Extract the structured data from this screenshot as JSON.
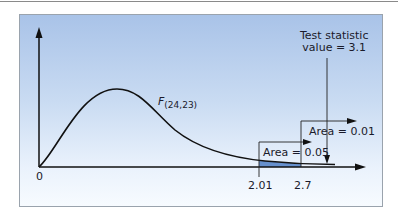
{
  "diagram": {
    "type": "F-distribution critical value illustration",
    "curve_label_main": "F",
    "curve_label_sub": "(24,23)",
    "origin_label": "0",
    "test_statistic": {
      "line1": "Test statistic",
      "line2": "value = 3.1",
      "value": 3.1
    },
    "critical_values": [
      {
        "x_label": "2.01",
        "area_label": "Area = 0.05",
        "area": 0.05
      },
      {
        "x_label": "2.7",
        "area_label": "Area = 0.01",
        "area": 0.01
      }
    ],
    "colors": {
      "panel_top": "#a9c3e8",
      "panel_bottom": "#f7fbff",
      "shade": "#4f7fc4",
      "line": "#111111"
    }
  }
}
